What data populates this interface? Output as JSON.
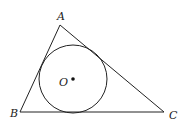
{
  "diagram": {
    "type": "geometry",
    "colors": {
      "stroke": "#222222",
      "background": "#ffffff"
    },
    "vertices": [
      {
        "name": "A",
        "x": 60,
        "y": 25,
        "label_x": 57,
        "label_y": 20
      },
      {
        "name": "B",
        "x": 20,
        "y": 112,
        "label_x": 10,
        "label_y": 117
      },
      {
        "name": "C",
        "x": 164,
        "y": 112,
        "label_x": 169,
        "label_y": 119
      }
    ],
    "incircle": {
      "center_label": "O",
      "cx": 73,
      "cy": 79,
      "r": 34,
      "label_x": 59,
      "label_y": 86
    }
  }
}
